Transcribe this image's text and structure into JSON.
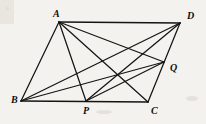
{
  "figure": {
    "background_color": "#f4f2ee",
    "ink_color": "#141414",
    "width": 206,
    "height": 124,
    "vertices": [
      {
        "id": "A",
        "label": "A",
        "x": 59,
        "y": 22,
        "label_x": 53,
        "label_y": 17
      },
      {
        "id": "D",
        "label": "D",
        "x": 180,
        "y": 23,
        "label_x": 187,
        "label_y": 19
      },
      {
        "id": "B",
        "label": "B",
        "x": 21,
        "y": 101,
        "label_x": 11,
        "label_y": 103
      },
      {
        "id": "P",
        "label": "P",
        "x": 86,
        "y": 101,
        "label_x": 83,
        "label_y": 114
      },
      {
        "id": "C",
        "label": "C",
        "x": 148,
        "y": 102,
        "label_x": 151,
        "label_y": 114
      },
      {
        "id": "Q",
        "label": "Q",
        "x": 164,
        "y": 62,
        "label_x": 170,
        "label_y": 71
      }
    ],
    "segments": [
      {
        "id": "AD",
        "from": "A",
        "to": "D",
        "weight": "thick"
      },
      {
        "id": "AB",
        "from": "A",
        "to": "B",
        "weight": "normal"
      },
      {
        "id": "BC",
        "from": "B",
        "to": "C",
        "weight": "thick"
      },
      {
        "id": "DC",
        "from": "D",
        "to": "C",
        "weight": "normal"
      },
      {
        "id": "AP",
        "from": "A",
        "to": "P",
        "weight": "normal"
      },
      {
        "id": "AQ",
        "from": "A",
        "to": "Q",
        "weight": "normal"
      },
      {
        "id": "AC",
        "from": "A",
        "to": "C",
        "weight": "normal"
      },
      {
        "id": "BD",
        "from": "B",
        "to": "D",
        "weight": "normal"
      },
      {
        "id": "BQ",
        "from": "B",
        "to": "Q",
        "weight": "normal"
      },
      {
        "id": "PQ",
        "from": "P",
        "to": "Q",
        "weight": "normal"
      },
      {
        "id": "PD",
        "from": "P",
        "to": "D",
        "weight": "normal"
      }
    ]
  }
}
